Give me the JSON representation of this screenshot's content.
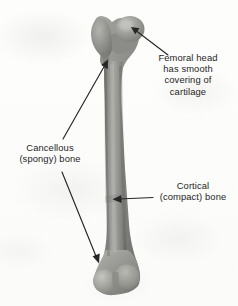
{
  "figure": {
    "view": "anterior whole-bone photograph",
    "background_color": "#fcfcfb",
    "bone_color": "#8d8d8a",
    "bone_highlight_color": "#bcbcb8",
    "bone_shadow_color": "#6a6a68",
    "annotation_color": "#1f1f1f"
  },
  "labels": [
    {
      "id": "femoral-head",
      "lines": [
        "Femoral head",
        "has smooth",
        "covering of",
        "cartilage"
      ],
      "align": "center",
      "points_to": "femoral head"
    },
    {
      "id": "cancellous",
      "lines": [
        "Cancellous",
        "(spongy) bone"
      ],
      "align": "center",
      "points_to": "proximal and distal epiphyses"
    },
    {
      "id": "cortical",
      "lines": [
        "Cortical",
        "(compact) bone"
      ],
      "align": "center",
      "points_to": "mid-shaft diaphysis"
    }
  ],
  "arrows": [
    {
      "id": "arrow-femoral-head",
      "from": [
        168,
        55
      ],
      "to": [
        131,
        27
      ]
    },
    {
      "id": "arrow-cancellous-upper",
      "from": [
        63,
        139
      ],
      "to": [
        108,
        61
      ]
    },
    {
      "id": "arrow-cancellous-lower",
      "from": [
        62,
        172
      ],
      "to": [
        99,
        263
      ]
    },
    {
      "id": "arrow-cortical",
      "from": [
        153,
        197
      ],
      "to": [
        113,
        199
      ]
    }
  ],
  "bone_parts": [
    {
      "name": "femoral-head",
      "region": "proximal, rounded ball"
    },
    {
      "name": "greater-trochanter",
      "region": "proximal, lateral block"
    },
    {
      "name": "neck",
      "region": "between head and shaft"
    },
    {
      "name": "shaft-diaphysis",
      "region": "long middle column"
    },
    {
      "name": "distal-condyles",
      "region": "bottom, double knuckle"
    }
  ]
}
